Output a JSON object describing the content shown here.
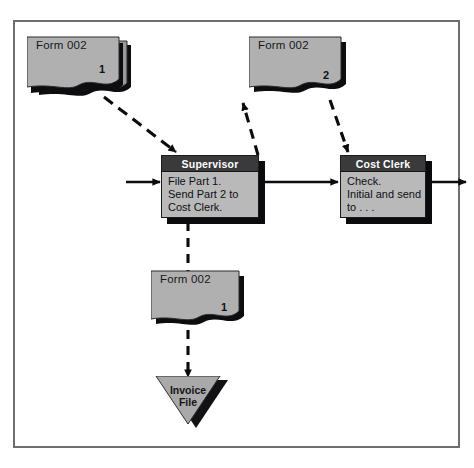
{
  "diagram": {
    "colors": {
      "frame_border": "#6e6e70",
      "doc_fill": "#b0b0b1",
      "doc_fill_back": "#9a9a9b",
      "doc_outline": "#2a2a2d",
      "doc_shadow": "#0d0d10",
      "box_header_bg": "#3a3a3c",
      "box_header_text": "#ffffff",
      "box_body_bg": "#b9b9ba",
      "box_shadow": "#0b0b0d",
      "triangle_fill": "#a9a9aa",
      "triangle_shadow": "#121215",
      "line": "#0b0b0d",
      "page_bg": "#ffffff"
    },
    "documents": [
      {
        "id": "form-top-left",
        "label": "Form 002",
        "copies": [
          "1",
          "2"
        ],
        "stacked": true
      },
      {
        "id": "form-top-right",
        "label": "Form 002",
        "copies": [
          "2"
        ],
        "stacked": false
      },
      {
        "id": "form-bottom",
        "label": "Form 002",
        "copies": [
          "1"
        ],
        "stacked": false
      }
    ],
    "process_boxes": [
      {
        "id": "supervisor",
        "header": "Supervisor",
        "lines": [
          "File Part 1.",
          "Send Part 2 to",
          "Cost Clerk."
        ]
      },
      {
        "id": "cost-clerk",
        "header": "Cost Clerk",
        "lines": [
          "Check.",
          "Initial and send",
          "to . . ."
        ]
      }
    ],
    "file_symbol": {
      "id": "invoice-file",
      "line1": "Invoice",
      "line2": "File"
    },
    "connectors": [
      {
        "id": "input-to-supervisor",
        "style": "solid",
        "direction": "right"
      },
      {
        "id": "form-top-left-to-supervisor",
        "style": "dashed",
        "direction": "down-right"
      },
      {
        "id": "supervisor-to-form-top-right",
        "style": "dashed",
        "direction": "up-left"
      },
      {
        "id": "form-top-right-to-cost-clerk",
        "style": "dashed",
        "direction": "down-right"
      },
      {
        "id": "supervisor-to-cost-clerk",
        "style": "solid",
        "direction": "right"
      },
      {
        "id": "cost-clerk-output",
        "style": "solid",
        "direction": "right"
      },
      {
        "id": "supervisor-to-form-bottom",
        "style": "dashed",
        "direction": "down"
      },
      {
        "id": "form-bottom-to-invoice-file",
        "style": "dashed",
        "direction": "down"
      }
    ]
  }
}
